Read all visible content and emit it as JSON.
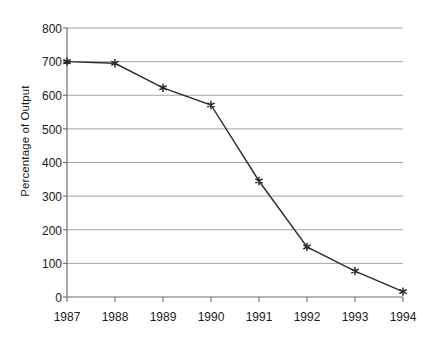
{
  "chart_data": {
    "type": "line",
    "title": "",
    "xlabel": "",
    "ylabel": "Percentage of Output",
    "categories": [
      "1987",
      "1988",
      "1989",
      "1990",
      "1991",
      "1992",
      "1993",
      "1994"
    ],
    "x": [
      1987,
      1988,
      1989,
      1990,
      1991,
      1992,
      1993,
      1994
    ],
    "values": [
      700,
      695,
      622,
      571,
      345,
      149,
      77,
      16
    ],
    "series": [
      {
        "name": "Percentage of Output",
        "values": [
          700,
          695,
          622,
          571,
          345,
          149,
          77,
          16
        ]
      }
    ],
    "ylim": [
      0,
      800
    ],
    "ytick_labels": [
      "0",
      "100",
      "200",
      "300",
      "400",
      "500",
      "600",
      "700",
      "800"
    ],
    "ytick_values": [
      0,
      100,
      200,
      300,
      400,
      500,
      600,
      700,
      800
    ],
    "xtick_labels": [
      "1987",
      "1988",
      "1989",
      "1990",
      "1991",
      "1992",
      "1993",
      "1994"
    ],
    "grid": true,
    "grid_axis": "y",
    "legend": false,
    "legend_position": "none",
    "marker": "star",
    "line_color": "#2b2b2b",
    "grid_color": "#9a9a9a",
    "axis_color": "#6e6e6e",
    "text_color": "#1a1a1a",
    "background_color": "#ffffff"
  }
}
